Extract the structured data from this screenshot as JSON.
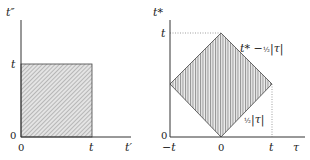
{
  "left_diagram": {
    "y_axis_label": "t″",
    "x_axis_label": "t′",
    "y_ticks": [
      "0",
      "t"
    ],
    "x_ticks": [
      "0",
      "t"
    ],
    "region": "square",
    "fill": "diagonal hatching"
  },
  "right_diagram": {
    "y_axis_label": "t*",
    "x_axis_label": "τ",
    "y_ticks": [
      "0",
      "t"
    ],
    "x_ticks": [
      "−t",
      "0",
      "t"
    ],
    "region": "diamond",
    "fill": "vertical hatching",
    "upper_boundary_label": {
      "main": "t* −",
      "frac": "½",
      "abs": "|τ|"
    },
    "lower_boundary_label": {
      "frac": "½",
      "abs": "|τ|"
    }
  },
  "colors": {
    "axis": "#333333",
    "hatch": "#8a8a8a",
    "fill_bg": "#e6e6e6",
    "dotted": "#777777"
  }
}
